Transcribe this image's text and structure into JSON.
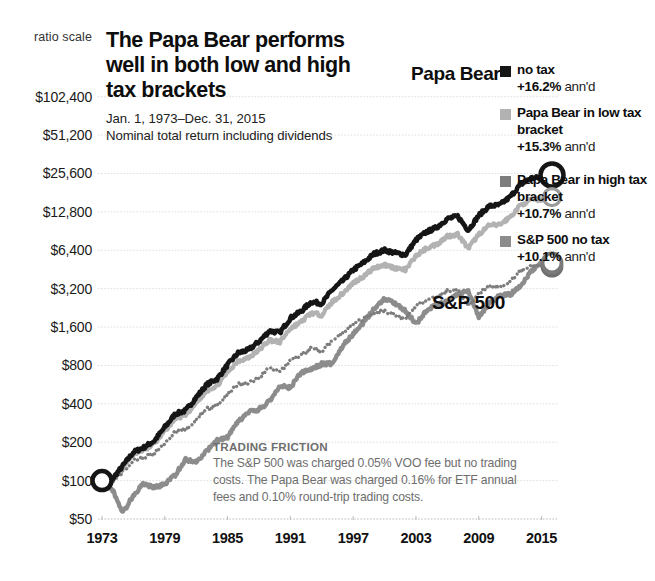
{
  "header": {
    "title": "The Papa Bear performs well in both low and high tax brackets",
    "subtitle_line1": "Jan. 1, 1973–Dec. 31, 2015",
    "subtitle_line2": "Nominal total return including dividends",
    "scale_note": "ratio scale"
  },
  "annotations": {
    "papa_bear_tag": "Papa Bear",
    "sp500_tag": "S&P 500",
    "friction_heading": "TRADING FRICTION",
    "friction_body": "The S&P 500 was charged 0.05% VOO fee but no trading costs. The Papa Bear was charged 0.16% for ETF annual fees and 0.10% round-trip trading costs."
  },
  "colors": {
    "no_tax": "#151515",
    "low_tax": "#b2b2b2",
    "high_tax": "#7d7d7d",
    "sp500": "#8c8c8c",
    "gridline": "#dedede",
    "text": "#1a1a1a",
    "muted": "#6e6e6e"
  },
  "legend": {
    "items": [
      {
        "swatch": "#151515",
        "name": "no tax",
        "pct": "+16.2%",
        "unit": "ann'd",
        "gap": false
      },
      {
        "swatch": "#b2b2b2",
        "name": "Papa Bear in low tax bracket",
        "pct": "+15.3%",
        "unit": "ann'd",
        "gap": false
      },
      {
        "swatch": "#7d7d7d",
        "name": "Papa Bear in high tax bracket",
        "pct": "+10.7%",
        "unit": "ann'd",
        "gap": true
      },
      {
        "swatch": "#8c8c8c",
        "name": "S&P 500 no tax",
        "pct": "+10.1%",
        "unit": "ann'd",
        "gap": false
      }
    ]
  },
  "chart_data": {
    "type": "line",
    "title": "The Papa Bear performs well in both low and high tax brackets",
    "subtitle": "Jan. 1, 1973–Dec. 31, 2015 — Nominal total return including dividends",
    "xlabel": "",
    "ylabel": "",
    "yscale": "log",
    "ylim": [
      50,
      160000
    ],
    "xlim": [
      1973,
      2016
    ],
    "grid": true,
    "legend_position": "right",
    "ytick_values": [
      102400,
      51200,
      25600,
      12800,
      6400,
      3200,
      1600,
      800,
      400,
      200,
      100,
      50
    ],
    "ytick_labels": [
      "$102,400",
      "$51,200",
      "$25,600",
      "$12,800",
      "$6,400",
      "$3,200",
      "$1,600",
      "$800",
      "$400",
      "$200",
      "$100",
      "$50"
    ],
    "xtick_values": [
      1973,
      1979,
      1985,
      1991,
      1997,
      2003,
      2009,
      2015
    ],
    "xtick_labels": [
      "1973",
      "1979",
      "1985",
      "1991",
      "1997",
      "2003",
      "2009",
      "2015"
    ],
    "start_value": 100,
    "x": [
      1973,
      1974,
      1975,
      1976,
      1977,
      1978,
      1979,
      1980,
      1981,
      1982,
      1983,
      1984,
      1985,
      1986,
      1987,
      1988,
      1989,
      1990,
      1991,
      1992,
      1993,
      1994,
      1995,
      1996,
      1997,
      1998,
      1999,
      2000,
      2001,
      2002,
      2003,
      2004,
      2005,
      2006,
      2007,
      2008,
      2009,
      2010,
      2011,
      2012,
      2013,
      2014,
      2015,
      2016
    ],
    "series": [
      {
        "name": "no tax",
        "style": "solid",
        "color": "#151515",
        "annualized": "+16.2%",
        "end_marker": true,
        "values": [
          100,
          103,
          131,
          167,
          182,
          205,
          262,
          333,
          355,
          449,
          566,
          628,
          808,
          1000,
          1060,
          1230,
          1490,
          1450,
          1880,
          2120,
          2520,
          2450,
          3130,
          3680,
          4480,
          5120,
          6000,
          6420,
          6100,
          5900,
          7700,
          8900,
          9700,
          11300,
          11800,
          9200,
          12000,
          14200,
          14500,
          16800,
          21000,
          23500,
          23800,
          24900
        ]
      },
      {
        "name": "Papa Bear in low tax bracket",
        "style": "solid",
        "color": "#b2b2b2",
        "annualized": "+15.3%",
        "end_marker": true,
        "values": [
          100,
          102,
          128,
          161,
          174,
          194,
          245,
          308,
          325,
          406,
          507,
          557,
          710,
          872,
          916,
          1055,
          1265,
          1220,
          1565,
          1750,
          2065,
          1990,
          2520,
          2935,
          3545,
          4010,
          4650,
          4930,
          4650,
          4470,
          5790,
          6620,
          7150,
          8260,
          8550,
          6600,
          8540,
          10020,
          10150,
          11650,
          14450,
          16030,
          16100,
          16700
        ]
      },
      {
        "name": "Papa Bear in high tax bracket",
        "style": "dotted",
        "color": "#7d7d7d",
        "annualized": "+10.7%",
        "end_marker": true,
        "values": [
          100,
          99,
          118,
          143,
          151,
          163,
          199,
          242,
          249,
          301,
          364,
          388,
          479,
          570,
          582,
          650,
          757,
          709,
          884,
          960,
          1100,
          1032,
          1270,
          1438,
          1686,
          1855,
          2095,
          2160,
          1985,
          1860,
          2345,
          2610,
          2745,
          3085,
          3110,
          2330,
          2935,
          3350,
          3305,
          3690,
          4460,
          4820,
          4730,
          4800
        ]
      },
      {
        "name": "S&P 500 no tax",
        "style": "solid",
        "color": "#8c8c8c",
        "annualized": "+10.1%",
        "end_marker": true,
        "values": [
          100,
          85,
          56,
          77,
          95,
          88,
          94,
          111,
          147,
          140,
          170,
          206,
          219,
          289,
          343,
          361,
          420,
          553,
          536,
          698,
          745,
          820,
          831,
          1143,
          1406,
          1731,
          2225,
          2692,
          2447,
          2156,
          1680,
          2162,
          2397,
          2514,
          2911,
          3071,
          1935,
          2448,
          2817,
          2877,
          3337,
          4418,
          5021,
          5090
        ]
      }
    ],
    "notes": [
      "TRADING FRICTION: The S&P 500 was charged 0.05% VOO fee but no trading costs. The Papa Bear was charged 0.16% for ETF annual fees and 0.10% round-trip trading costs."
    ]
  }
}
